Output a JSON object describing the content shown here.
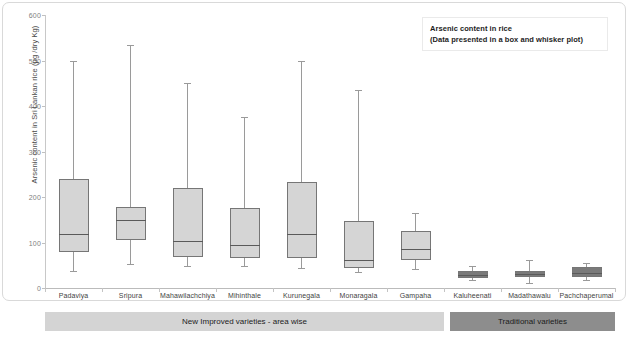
{
  "figure": {
    "legend_line1": "Arsenic content in rice",
    "legend_line2": "(Data presented in a box and whisker plot)"
  },
  "axis": {
    "y_title": "Arsenic content in Sri Lankan rice (µg /dry Kg)",
    "y_ticks": [
      "0",
      "100",
      "200",
      "300",
      "400",
      "500",
      "600"
    ]
  },
  "groups": {
    "new_label": "New Improved varieties - area wise",
    "traditional_label": "Traditional varieties"
  },
  "chart_data": {
    "type": "box",
    "title": "Arsenic content in rice",
    "subtitle": "(Data presented in a box and whisker plot)",
    "xlabel": "",
    "ylabel": "Arsenic content in Sri Lankan rice (µg /dry Kg)",
    "ylim": [
      0,
      600
    ],
    "ytick_values": [
      0,
      100,
      200,
      300,
      400,
      500,
      600
    ],
    "grid": false,
    "legend_position": "top-right",
    "categories": [
      "Padaviya",
      "Sripura",
      "Mahawilachchiya",
      "Mihinthale",
      "Kurunegala",
      "Monaragala",
      "Gampaha",
      "Kaluheenati",
      "Madathawalu",
      "Pachchaperumal"
    ],
    "group_assignment": [
      "New Improved varieties - area wise",
      "New Improved varieties - area wise",
      "New Improved varieties - area wise",
      "New Improved varieties - area wise",
      "New Improved varieties - area wise",
      "New Improved varieties - area wise",
      "New Improved varieties - area wise",
      "Traditional varieties",
      "Traditional varieties",
      "Traditional varieties"
    ],
    "boxes": [
      {
        "category": "Padaviya",
        "whisker_low": 38,
        "q1": 80,
        "median": 118,
        "q3": 240,
        "whisker_high": 500,
        "fill": "#d5d5d5"
      },
      {
        "category": "Sripura",
        "whisker_low": 52,
        "q1": 105,
        "median": 150,
        "q3": 177,
        "whisker_high": 535,
        "fill": "#d5d5d5"
      },
      {
        "category": "Mahawilachchiya",
        "whisker_low": 48,
        "q1": 68,
        "median": 103,
        "q3": 220,
        "whisker_high": 450,
        "fill": "#d5d5d5"
      },
      {
        "category": "Mihinthale",
        "whisker_low": 48,
        "q1": 65,
        "median": 95,
        "q3": 175,
        "whisker_high": 375,
        "fill": "#d5d5d5"
      },
      {
        "category": "Kurunegala",
        "whisker_low": 45,
        "q1": 65,
        "median": 118,
        "q3": 232,
        "whisker_high": 500,
        "fill": "#d5d5d5"
      },
      {
        "category": "Monaragala",
        "whisker_low": 35,
        "q1": 45,
        "median": 62,
        "q3": 148,
        "whisker_high": 435,
        "fill": "#d5d5d5"
      },
      {
        "category": "Gampaha",
        "whisker_low": 42,
        "q1": 62,
        "median": 85,
        "q3": 125,
        "whisker_high": 165,
        "fill": "#d5d5d5"
      },
      {
        "category": "Kaluheenati",
        "whisker_low": 18,
        "q1": 22,
        "median": 28,
        "q3": 38,
        "whisker_high": 48,
        "fill": "#7a7a7a"
      },
      {
        "category": "Madathawalu",
        "whisker_low": 10,
        "q1": 24,
        "median": 30,
        "q3": 38,
        "whisker_high": 62,
        "fill": "#7a7a7a"
      },
      {
        "category": "Pachchaperumal",
        "whisker_low": 18,
        "q1": 24,
        "median": 32,
        "q3": 46,
        "whisker_high": 55,
        "fill": "#7a7a7a"
      }
    ]
  }
}
